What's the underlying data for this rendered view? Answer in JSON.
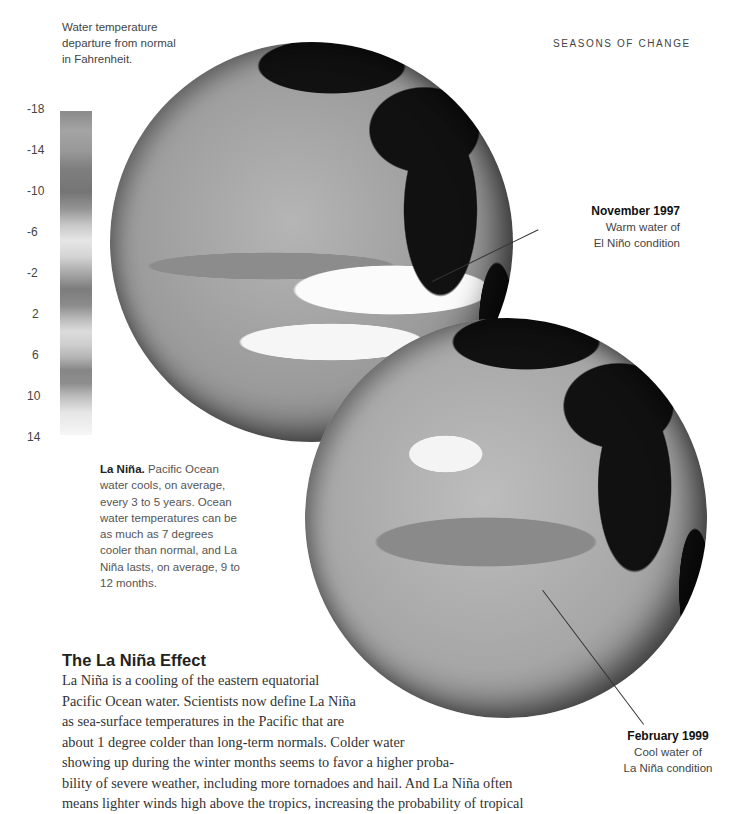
{
  "section_label": "SEASONS OF CHANGE",
  "legend": {
    "title": "Water temperature departure from normal in Fahrenheit.",
    "ticks": [
      "-18",
      "-14",
      "-10",
      "-6",
      "-2",
      "2",
      "6",
      "10",
      "14"
    ]
  },
  "globes": [
    {
      "name": "globe-november-1997",
      "callout_date": "November 1997",
      "callout_line1": "Warm water of",
      "callout_line2": "El Niño condition"
    },
    {
      "name": "globe-february-1999",
      "callout_date": "February 1999",
      "callout_line1": "Cool water of",
      "callout_line2": "La Niña condition"
    }
  ],
  "sidebar_note": {
    "lead": "La Niña.",
    "text": " Pacific Ocean water cools, on average, every 3 to 5 years. Ocean water temperatures can be as much as 7 degrees cooler than normal, and La Niña lasts, on average, 9 to 12 months."
  },
  "article": {
    "heading": "The La Niña Effect",
    "lines": [
      "La Niña is a cooling of the eastern equatorial",
      "Pacific Ocean water. Scientists now define La Niña",
      "as sea-surface temperatures in the Pacific that are",
      "about 1 degree colder than long-term normals. Colder water",
      "showing up during the winter months seems to favor a higher proba-",
      "bility of severe weather, including more tornadoes and hail. And La Niña often",
      "means lighter winds high above the tropics, increasing the probability of tropical"
    ]
  }
}
